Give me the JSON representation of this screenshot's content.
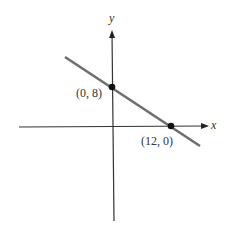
{
  "diagram": {
    "type": "line-graph",
    "axes": {
      "x_label": "x",
      "y_label": "y"
    },
    "line": {
      "equation_points": [
        [
          0,
          8
        ],
        [
          12,
          0
        ]
      ],
      "color": "#6e6e6e"
    },
    "points": [
      {
        "label": "(0, 8)",
        "x": 0,
        "y": 8
      },
      {
        "label": "(12, 0)",
        "x": 12,
        "y": 0
      }
    ],
    "colors": {
      "axis": "#333333",
      "line": "#6e6e6e",
      "point": "#111111"
    }
  }
}
